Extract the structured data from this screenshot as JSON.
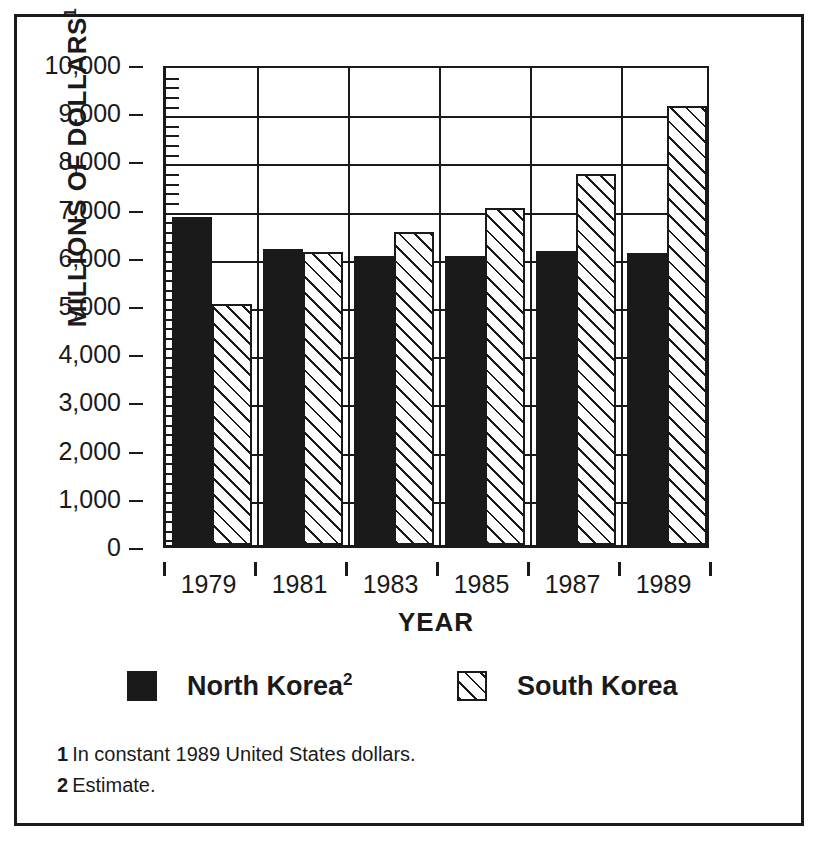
{
  "chart_data": {
    "type": "bar",
    "title": "",
    "subtitle": "",
    "xlabel": "YEAR",
    "ylabel": "MILLIONS OF DOLLARS",
    "ylabel_footnote_marker": "1",
    "categories": [
      "1979",
      "1981",
      "1983",
      "1985",
      "1987",
      "1989"
    ],
    "ylim": [
      0,
      10000
    ],
    "ytick_values": [
      0,
      1000,
      2000,
      3000,
      4000,
      5000,
      6000,
      7000,
      8000,
      9000,
      10000
    ],
    "ytick_labels": [
      "0",
      "1,000",
      "2,000",
      "3,000",
      "4,000",
      "5,000",
      "6,000",
      "7,000",
      "8,000",
      "9,000",
      "10,000"
    ],
    "yminor_tick_step": 200,
    "grid": "horizontal-and-vertical",
    "legend_position": "bottom",
    "series": [
      {
        "name": "North Korea",
        "footnote_marker": "2",
        "pattern": "solid-black",
        "color": "#1a1a1a",
        "values": [
          6800,
          6150,
          6000,
          6000,
          6100,
          6050
        ]
      },
      {
        "name": "South Korea",
        "footnote_marker": "",
        "pattern": "diagonal-hatch",
        "color": "#1a1a1a",
        "values": [
          5000,
          6080,
          6500,
          7000,
          7700,
          9100
        ]
      }
    ]
  },
  "footnotes": [
    {
      "marker": "1",
      "text": "In constant 1989 United States dollars."
    },
    {
      "marker": "2",
      "text": "Estimate."
    }
  ]
}
